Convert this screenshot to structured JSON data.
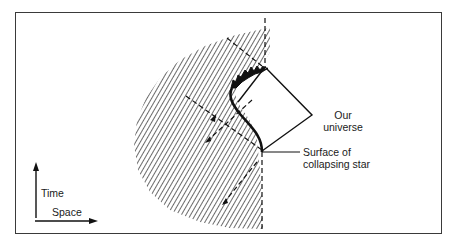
{
  "diagram": {
    "labels": {
      "our_universe_line1": "Our",
      "our_universe_line2": "universe",
      "surface_line1": "Surface of",
      "surface_line2": "collapsing star",
      "axis_time": "Time",
      "axis_space": "Space"
    },
    "colors": {
      "ink": "#1a1a1a",
      "frame": "#3a3a3a",
      "hatch": "#2a2a2a",
      "background": "#ffffff"
    },
    "elements": [
      "hatched-region-star-interior",
      "our-universe-diamond",
      "surface-of-collapsing-star-curve",
      "singularity-jagged-edge",
      "dashed-light-cone-lines",
      "time-axis-arrow",
      "space-axis-arrow"
    ]
  }
}
